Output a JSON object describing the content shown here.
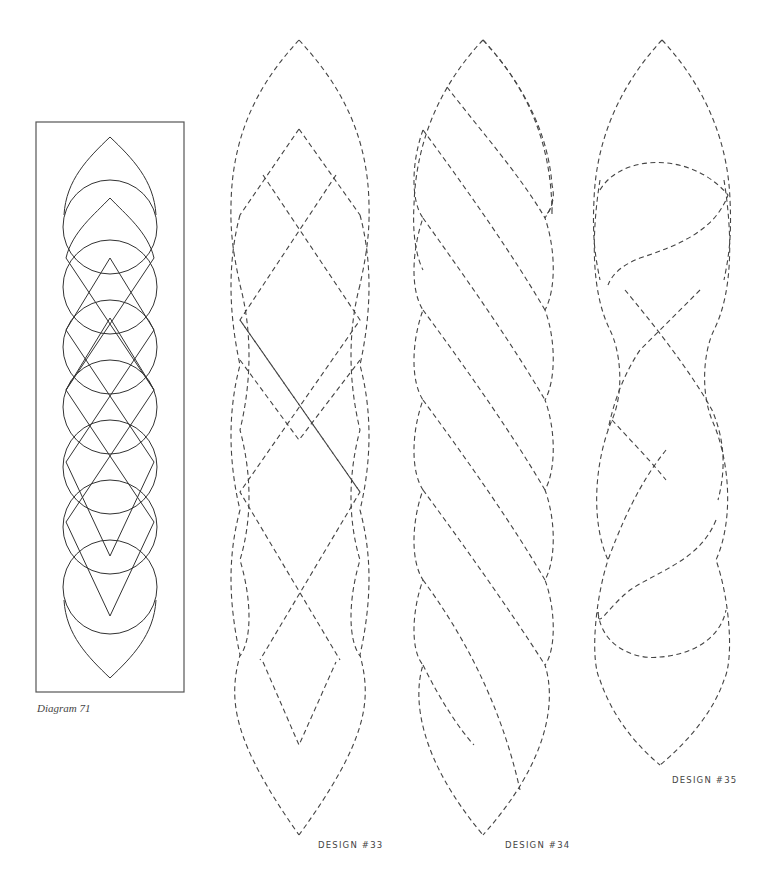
{
  "diagram": {
    "caption": "Diagram 71",
    "stroke_color": "#333333"
  },
  "designs": [
    {
      "label": "DESIGN #33",
      "style": "dashed",
      "motif": "double pointed lens with diamond lattice braid"
    },
    {
      "label": "DESIGN #34",
      "style": "dashed",
      "motif": "twisted rope with diagonal strands"
    },
    {
      "label": "DESIGN #35",
      "style": "dashed",
      "motif": "cable twist with S-curve crossovers"
    }
  ],
  "colors": {
    "background": "#ffffff",
    "line": "#444444"
  }
}
